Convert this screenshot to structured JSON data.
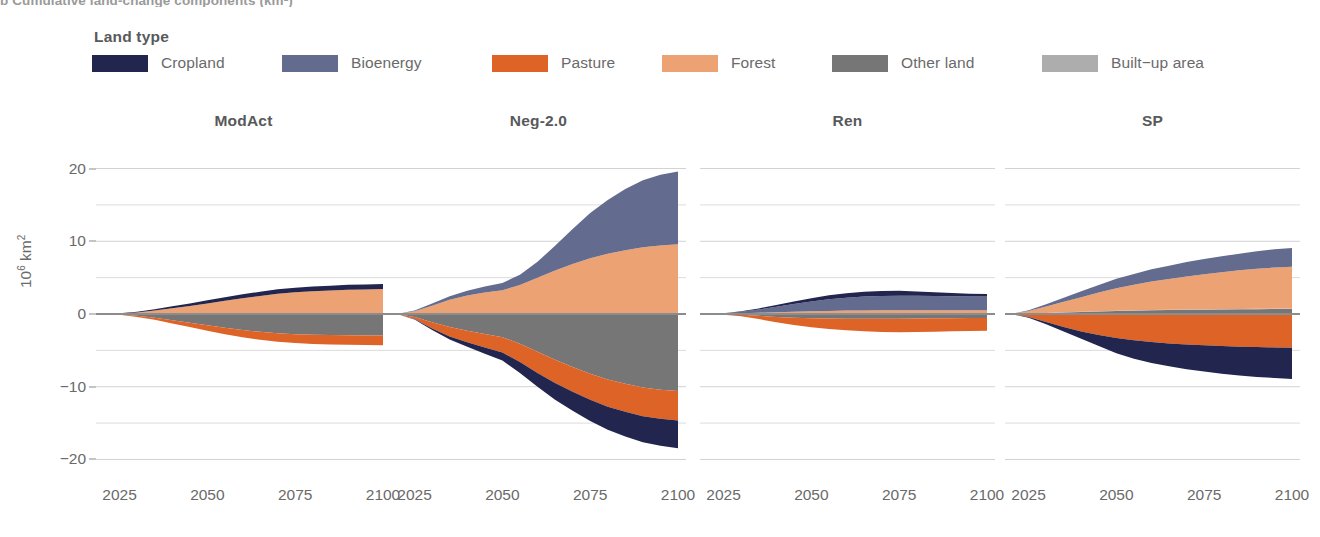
{
  "figure": {
    "clipped_top_caption": "b Cumulative land-change components (km²)",
    "y_axis_label_base": "10",
    "y_axis_label_sup": "6",
    "y_axis_label_unit": " km",
    "y_axis_unit_sup": "2"
  },
  "legend": {
    "title": "Land type",
    "items": [
      {
        "label": "Cropland",
        "color": "#22264f",
        "key": "cropland"
      },
      {
        "label": "Bioenergy",
        "color": "#636c8e",
        "key": "bioenergy"
      },
      {
        "label": "Pasture",
        "color": "#de6327",
        "key": "pasture"
      },
      {
        "label": "Forest",
        "color": "#eda273",
        "key": "forest"
      },
      {
        "label": "Other land",
        "color": "#767676",
        "key": "other_land"
      },
      {
        "label": "Built−up area",
        "color": "#adadad",
        "key": "builtup"
      }
    ]
  },
  "axes": {
    "y_ticks": [
      20,
      10,
      0,
      -10,
      -20
    ],
    "y_tick_labels": [
      "20",
      "10",
      "0",
      "−10",
      "−20"
    ],
    "y_minor_gridlines": [
      15,
      5,
      -5,
      -15
    ],
    "ylim": [
      -22,
      22
    ],
    "x_ticks": [
      2025,
      2050,
      2075,
      2100
    ],
    "x_tick_labels": [
      "2025",
      "2050",
      "2075",
      "2100"
    ],
    "xlim": [
      2020,
      2100
    ]
  },
  "chart_data": {
    "type": "area",
    "xlabel": "",
    "ylabel": "10^6 km^2",
    "ylim": [
      -22,
      22
    ],
    "xlim": [
      2020,
      2100
    ],
    "grid": true,
    "legend_position": "top",
    "stacking": "diverging-stacked-area (positive up, negative down)",
    "x": [
      2020,
      2025,
      2030,
      2035,
      2040,
      2045,
      2050,
      2055,
      2060,
      2065,
      2070,
      2075,
      2080,
      2085,
      2090,
      2095,
      2100
    ],
    "panels": [
      {
        "name": "ModAct",
        "series": [
          {
            "name": "Cropland",
            "color": "#22264f",
            "values": [
              0,
              0.05,
              0.1,
              0.18,
              0.26,
              0.34,
              0.42,
              0.48,
              0.54,
              0.58,
              0.62,
              0.64,
              0.66,
              0.67,
              0.68,
              0.69,
              0.7
            ]
          },
          {
            "name": "Bioenergy",
            "color": "#636c8e",
            "values": [
              0,
              0,
              0,
              0,
              0,
              0,
              0,
              0,
              0,
              0,
              0,
              0,
              0,
              0,
              0,
              0,
              0
            ]
          },
          {
            "name": "Forest",
            "color": "#eda273",
            "values": [
              0,
              0.05,
              0.2,
              0.45,
              0.75,
              1.05,
              1.4,
              1.75,
              2.1,
              2.4,
              2.7,
              2.9,
              3.05,
              3.15,
              3.25,
              3.3,
              3.35
            ]
          },
          {
            "name": "Built-up area",
            "color": "#adadad",
            "values": [
              0,
              0.01,
              0.02,
              0.03,
              0.04,
              0.05,
              0.06,
              0.07,
              0.07,
              0.08,
              0.08,
              0.08,
              0.08,
              0.08,
              0.08,
              0.08,
              0.08
            ]
          },
          {
            "name": "Pasture",
            "color": "#de6327",
            "values": [
              0,
              -0.05,
              -0.15,
              -0.3,
              -0.45,
              -0.6,
              -0.75,
              -0.88,
              -1.0,
              -1.1,
              -1.18,
              -1.22,
              -1.26,
              -1.28,
              -1.3,
              -1.32,
              -1.34
            ]
          },
          {
            "name": "Other land",
            "color": "#767676",
            "values": [
              0,
              -0.06,
              -0.25,
              -0.5,
              -0.85,
              -1.2,
              -1.55,
              -1.9,
              -2.2,
              -2.45,
              -2.65,
              -2.78,
              -2.86,
              -2.9,
              -2.92,
              -2.94,
              -2.96
            ]
          }
        ],
        "positive_total_2100": 4.1,
        "negative_total_2100": -4.3
      },
      {
        "name": "Neg-2.0",
        "series": [
          {
            "name": "Cropland",
            "color": "#22264f",
            "values": [
              0,
              0,
              0,
              0,
              0,
              0,
              0,
              0,
              0,
              0,
              0,
              0,
              0,
              0,
              0,
              0,
              0
            ]
          },
          {
            "name": "Bioenergy",
            "color": "#636c8e",
            "values": [
              0,
              0.1,
              0.3,
              0.5,
              0.65,
              0.8,
              1.0,
              1.4,
              2.2,
              3.4,
              4.8,
              6.2,
              7.4,
              8.4,
              9.2,
              9.7,
              10.0
            ]
          },
          {
            "name": "Forest",
            "color": "#eda273",
            "values": [
              0,
              0.35,
              1.1,
              1.9,
              2.5,
              2.9,
              3.2,
              3.9,
              4.9,
              5.9,
              6.8,
              7.6,
              8.2,
              8.7,
              9.1,
              9.35,
              9.5
            ]
          },
          {
            "name": "Built-up area",
            "color": "#adadad",
            "values": [
              0,
              0.02,
              0.04,
              0.05,
              0.06,
              0.07,
              0.07,
              0.08,
              0.08,
              0.08,
              0.08,
              0.08,
              0.08,
              0.08,
              0.08,
              0.08,
              0.08
            ]
          },
          {
            "name": "Pasture",
            "color": "#de6327",
            "values": [
              0,
              -0.3,
              -0.85,
              -1.3,
              -1.6,
              -1.85,
              -2.1,
              -2.5,
              -2.9,
              -3.2,
              -3.4,
              -3.6,
              -3.75,
              -3.85,
              -3.95,
              -4.0,
              -4.05
            ]
          },
          {
            "name": "Other land",
            "color": "#767676",
            "values": [
              0,
              -0.4,
              -1.15,
              -1.8,
              -2.3,
              -2.75,
              -3.2,
              -4.1,
              -5.2,
              -6.3,
              -7.3,
              -8.2,
              -9.0,
              -9.6,
              -10.1,
              -10.4,
              -10.6
            ]
          },
          {
            "name": "Cropland (neg)",
            "color": "#22264f",
            "values": [
              0,
              -0.05,
              -0.2,
              -0.4,
              -0.6,
              -0.85,
              -1.1,
              -1.5,
              -1.9,
              -2.3,
              -2.6,
              -2.9,
              -3.15,
              -3.4,
              -3.6,
              -3.72,
              -3.8
            ]
          }
        ],
        "positive_total_2100": 19.5,
        "negative_total_2100": -18.5
      },
      {
        "name": "Ren",
        "series": [
          {
            "name": "Cropland",
            "color": "#22264f",
            "values": [
              0,
              0.03,
              0.08,
              0.15,
              0.25,
              0.35,
              0.45,
              0.55,
              0.62,
              0.66,
              0.68,
              0.66,
              0.6,
              0.52,
              0.44,
              0.38,
              0.34
            ]
          },
          {
            "name": "Bioenergy",
            "color": "#636c8e",
            "values": [
              0,
              0.05,
              0.2,
              0.45,
              0.75,
              1.05,
              1.35,
              1.6,
              1.78,
              1.9,
              1.98,
              2.0,
              1.98,
              1.95,
              1.92,
              1.9,
              1.9
            ]
          },
          {
            "name": "Forest",
            "color": "#eda273",
            "values": [
              0,
              0.03,
              0.08,
              0.14,
              0.2,
              0.26,
              0.32,
              0.36,
              0.4,
              0.42,
              0.44,
              0.45,
              0.45,
              0.45,
              0.45,
              0.45,
              0.45
            ]
          },
          {
            "name": "Built-up area",
            "color": "#adadad",
            "values": [
              0,
              0.01,
              0.02,
              0.03,
              0.04,
              0.05,
              0.06,
              0.06,
              0.07,
              0.07,
              0.07,
              0.07,
              0.07,
              0.07,
              0.07,
              0.07,
              0.07
            ]
          },
          {
            "name": "Pasture",
            "color": "#de6327",
            "values": [
              0,
              -0.05,
              -0.2,
              -0.45,
              -0.75,
              -1.0,
              -1.25,
              -1.45,
              -1.6,
              -1.72,
              -1.8,
              -1.85,
              -1.86,
              -1.84,
              -1.8,
              -1.78,
              -1.76
            ]
          },
          {
            "name": "Other land",
            "color": "#767676",
            "values": [
              0,
              -0.04,
              -0.12,
              -0.25,
              -0.4,
              -0.5,
              -0.58,
              -0.62,
              -0.65,
              -0.66,
              -0.66,
              -0.65,
              -0.63,
              -0.6,
              -0.58,
              -0.56,
              -0.55
            ]
          }
        ],
        "positive_total_2100": 2.7,
        "negative_total_2100": -2.4
      },
      {
        "name": "SP",
        "series": [
          {
            "name": "Cropland",
            "color": "#22264f",
            "values": [
              0,
              0,
              0,
              0,
              0,
              0,
              0,
              0,
              0,
              0,
              0,
              0,
              0,
              0,
              0,
              0,
              0
            ]
          },
          {
            "name": "Bioenergy",
            "color": "#636c8e",
            "values": [
              0,
              0.1,
              0.3,
              0.55,
              0.8,
              1.05,
              1.3,
              1.5,
              1.7,
              1.85,
              2.0,
              2.1,
              2.2,
              2.3,
              2.4,
              2.5,
              2.55
            ]
          },
          {
            "name": "Forest",
            "color": "#eda273",
            "values": [
              0,
              0.35,
              0.9,
              1.45,
              2.0,
              2.55,
              3.1,
              3.5,
              3.9,
              4.2,
              4.5,
              4.8,
              5.05,
              5.3,
              5.5,
              5.65,
              5.75
            ]
          },
          {
            "name": "Other land",
            "color": "#767676",
            "values": [
              0,
              0.05,
              0.12,
              0.2,
              0.28,
              0.34,
              0.4,
              0.45,
              0.5,
              0.54,
              0.58,
              0.6,
              0.62,
              0.64,
              0.66,
              0.68,
              0.7
            ]
          },
          {
            "name": "Built-up area",
            "color": "#adadad",
            "values": [
              0,
              0.01,
              0.02,
              0.03,
              0.04,
              0.05,
              0.05,
              0.06,
              0.06,
              0.06,
              0.06,
              0.06,
              0.06,
              0.06,
              0.06,
              0.06,
              0.06
            ]
          },
          {
            "name": "Pasture",
            "color": "#de6327",
            "values": [
              0,
              -0.4,
              -1.1,
              -1.8,
              -2.4,
              -2.9,
              -3.3,
              -3.6,
              -3.85,
              -4.05,
              -4.2,
              -4.3,
              -4.4,
              -4.5,
              -4.55,
              -4.6,
              -4.65
            ]
          },
          {
            "name": "Cropland (neg)",
            "color": "#22264f",
            "values": [
              0,
              -0.1,
              -0.3,
              -0.6,
              -1.0,
              -1.5,
              -2.1,
              -2.55,
              -2.9,
              -3.15,
              -3.4,
              -3.6,
              -3.8,
              -3.95,
              -4.1,
              -4.2,
              -4.3
            ]
          }
        ],
        "positive_total_2100": 9.0,
        "negative_total_2100": -8.95
      }
    ]
  }
}
